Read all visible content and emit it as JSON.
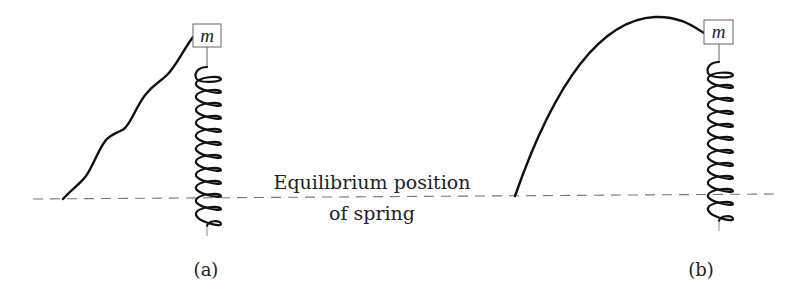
{
  "diagram": {
    "equilibrium_label_line1": "Equilibrium position",
    "equilibrium_label_line2": "of spring",
    "panels": [
      {
        "caption": "(a)",
        "mass_label": "m",
        "trajectory": "wavy rising path"
      },
      {
        "caption": "(b)",
        "mass_label": "m",
        "trajectory": "parabolic arc"
      }
    ],
    "colors": {
      "stroke": "#111111",
      "dashed_line": "#777777",
      "box_border": "#666666",
      "text": "#222222"
    }
  }
}
